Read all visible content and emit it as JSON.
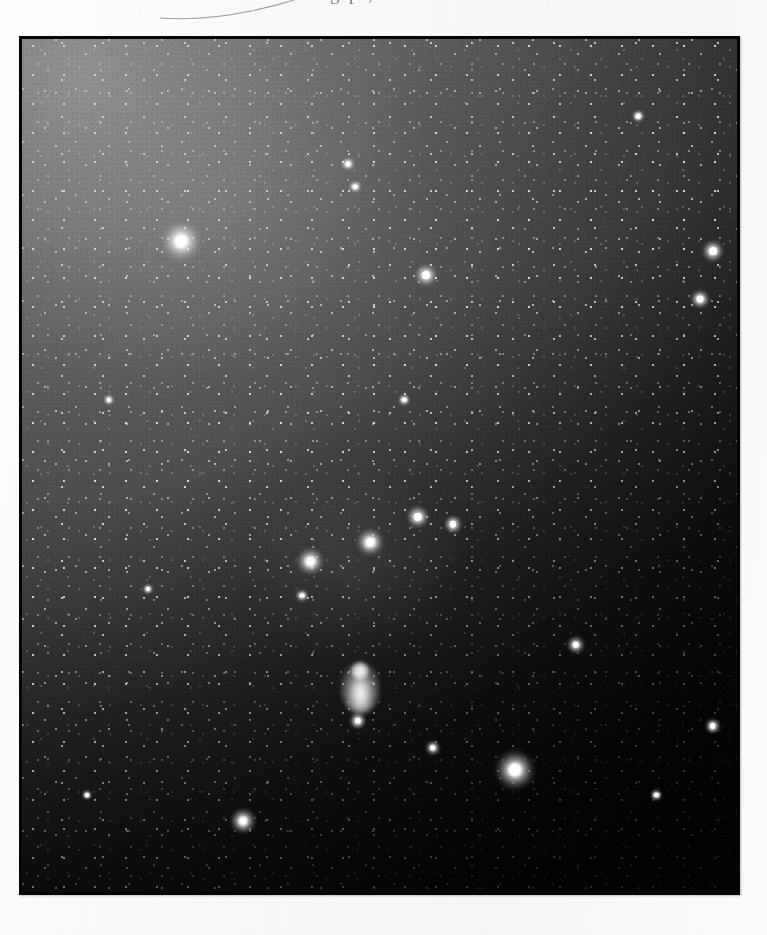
{
  "page": {
    "background_color": "#fbfbfc",
    "header_text_partial": "g  p     ,  r",
    "ink_mark": "hand-drawn-arc"
  },
  "plate": {
    "frame": {
      "x": 19,
      "y": 36,
      "width": 721,
      "height": 859,
      "border_color": "#050505"
    },
    "subject": "Orion constellation wide-field star field",
    "sky_background_hex_brightest": "#8e8e8e",
    "sky_background_hex_darkest": "#0a0a0a",
    "gradient_direction": "bright upper-left to dark lower-right",
    "catalog_stars": [
      {
        "name": "betelgeuse",
        "x": 0.221,
        "y": 0.235,
        "r": 13.0,
        "mag": 0.5
      },
      {
        "name": "rigel",
        "x": 0.684,
        "y": 0.851,
        "r": 13.5,
        "mag": 0.1
      },
      {
        "name": "bellatrix",
        "x": 0.958,
        "y": 0.247,
        "r": 7.5,
        "mag": 1.6
      },
      {
        "name": "saiph",
        "x": 0.307,
        "y": 0.91,
        "r": 8.5,
        "mag": 2.1
      },
      {
        "name": "alnilam",
        "x": 0.483,
        "y": 0.586,
        "r": 9.0,
        "mag": 1.7
      },
      {
        "name": "alnitak",
        "x": 0.4,
        "y": 0.608,
        "r": 8.8,
        "mag": 1.8
      },
      {
        "name": "mintaka",
        "x": 0.549,
        "y": 0.556,
        "r": 7.8,
        "mag": 2.2
      },
      {
        "name": "m42-orion-nebula",
        "x": 0.469,
        "y": 0.755,
        "r": 12.0,
        "mag": 4.0
      },
      {
        "name": "iota-orionis",
        "x": 0.466,
        "y": 0.794,
        "r": 6.0,
        "mag": 2.8
      },
      {
        "name": "star-upper-mid",
        "x": 0.56,
        "y": 0.275,
        "r": 7.5,
        "mag": 2.4
      },
      {
        "name": "star-right-upper",
        "x": 0.94,
        "y": 0.303,
        "r": 6.5,
        "mag": 2.9
      },
      {
        "name": "star-mid-right",
        "x": 0.598,
        "y": 0.565,
        "r": 6.0,
        "mag": 3.0
      },
      {
        "name": "star-lower-right",
        "x": 0.768,
        "y": 0.705,
        "r": 6.2,
        "mag": 3.0
      },
      {
        "name": "star-far-right",
        "x": 0.958,
        "y": 0.8,
        "r": 5.5,
        "mag": 3.3
      },
      {
        "name": "star-lower-center",
        "x": 0.57,
        "y": 0.825,
        "r": 5.2,
        "mag": 3.4
      },
      {
        "name": "star-upper-left-b",
        "x": 0.452,
        "y": 0.145,
        "r": 4.8,
        "mag": 3.6
      },
      {
        "name": "star-upper-left-c",
        "x": 0.462,
        "y": 0.172,
        "r": 4.4,
        "mag": 3.8
      },
      {
        "name": "star-belt-west",
        "x": 0.388,
        "y": 0.648,
        "r": 4.6,
        "mag": 3.7
      },
      {
        "name": "star-left-mid",
        "x": 0.12,
        "y": 0.42,
        "r": 4.0,
        "mag": 4.0
      },
      {
        "name": "star-left-low",
        "x": 0.175,
        "y": 0.64,
        "r": 3.8,
        "mag": 4.1
      },
      {
        "name": "star-center-high",
        "x": 0.53,
        "y": 0.42,
        "r": 4.2,
        "mag": 4.0
      },
      {
        "name": "star-right-low",
        "x": 0.88,
        "y": 0.88,
        "r": 4.0,
        "mag": 4.1
      },
      {
        "name": "star-top-right",
        "x": 0.855,
        "y": 0.09,
        "r": 4.2,
        "mag": 4.0
      },
      {
        "name": "star-bottom-left",
        "x": 0.09,
        "y": 0.88,
        "r": 3.6,
        "mag": 4.2
      }
    ]
  }
}
